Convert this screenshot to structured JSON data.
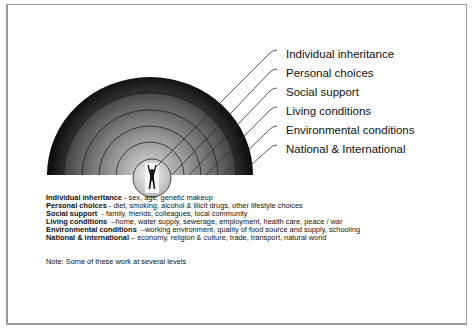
{
  "diagram": {
    "type": "concentric-semicircle",
    "center_figure": "person-arms-raised",
    "layers": [
      {
        "label": "Individual inheritance",
        "fill_outer": "#b8b8b8",
        "fill_inner": "#d8d8d8"
      },
      {
        "label": "Personal choices",
        "fill_outer": "#9a9a9a",
        "fill_inner": "#b8b8b8"
      },
      {
        "label": "Social support",
        "fill_outer": "#7e7e7e",
        "fill_inner": "#a0a0a0"
      },
      {
        "label": "Living conditions",
        "fill_outer": "#626262",
        "fill_inner": "#858585"
      },
      {
        "label": "Environmental conditions",
        "fill_outer": "#434343",
        "fill_inner": "#666666"
      },
      {
        "label": "National & International",
        "fill_outer": "#0c0c0c",
        "fill_inner": "#2c2c2c"
      }
    ]
  },
  "legend": [
    {
      "term": "Individual inheritance",
      "sep": " - ",
      "desc": "sex, age, genetic makeup"
    },
    {
      "term": "Personal choices",
      "sep": " - ",
      "desc": "diet, smoking, alcohol & illicit drugs, other lifestyle choices"
    },
    {
      "term": "Social support",
      "sep": "  - ",
      "desc": "family, friends, colleagues, local community"
    },
    {
      "term": "Living conditions",
      "sep": "  –",
      "desc": "home, water supply, sewerage, employment, health care, peace / war"
    },
    {
      "term": "Environmental conditions",
      "sep": "  –",
      "desc": "working environment, quality of food source and supply, schooling"
    },
    {
      "term": "National & international",
      "sep": " – ",
      "desc": "economy, religion & culture, trade, transport, natural world"
    }
  ],
  "note": "Note: Some of these work at several levels"
}
